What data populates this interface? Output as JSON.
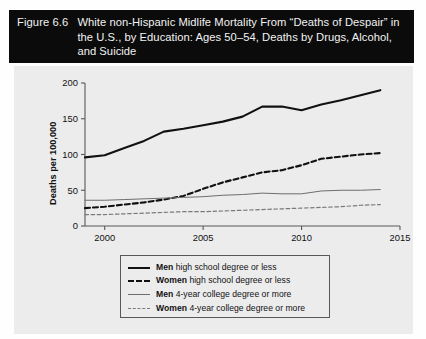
{
  "figure": {
    "number": "Figure 6.6",
    "title": "White non-Hispanic Midlife Mortality From “Deaths of Despair” in the U.S., by Education: Ages 50–54, Deaths by Drugs, Alcohol, and Suicide"
  },
  "colors": {
    "title_bar_bg": "#0b0b0b",
    "title_bar_text": "#f2f2f2",
    "panel_bg": "#ececed",
    "series_dark": "#111111",
    "series_gray": "#6e6e70",
    "axis": "#58585a"
  },
  "legend": {
    "entries": [
      {
        "emphasis": "Men",
        "label": " high school degree or less",
        "style": "solid-thick"
      },
      {
        "emphasis": "Women",
        "label": " high school degree or less",
        "style": "dash-thick"
      },
      {
        "emphasis": "Men",
        "label": " 4-year college degree or more",
        "style": "solid-thin"
      },
      {
        "emphasis": "Women",
        "label": " 4-year college degree or more",
        "style": "dash-thin"
      }
    ]
  },
  "chart_data": {
    "type": "line",
    "title": "White non-Hispanic Midlife Mortality From “Deaths of Despair” in the U.S., by Education: Ages 50–54, Deaths by Drugs, Alcohol, and Suicide",
    "xlabel": "",
    "ylabel": "Deaths per 100,000",
    "xlim": [
      1999,
      2015
    ],
    "ylim": [
      0,
      200
    ],
    "xticks": [
      2000,
      2005,
      2010,
      2015
    ],
    "yticks": [
      0,
      50,
      100,
      150,
      200
    ],
    "grid": false,
    "legend_position": "bottom-center",
    "x": [
      1999,
      2000,
      2001,
      2002,
      2003,
      2004,
      2005,
      2006,
      2007,
      2008,
      2009,
      2010,
      2011,
      2012,
      2013,
      2014
    ],
    "series": [
      {
        "name": "Men high school degree or less",
        "style": "solid-thick",
        "color": "#111111",
        "values": [
          96,
          99,
          109,
          119,
          132,
          136,
          141,
          146,
          153,
          167,
          167,
          162,
          170,
          176,
          183,
          190
        ]
      },
      {
        "name": "Women high school degree or less",
        "style": "dash-thick",
        "color": "#111111",
        "values": [
          25,
          27,
          30,
          33,
          37,
          42,
          52,
          61,
          68,
          75,
          78,
          85,
          94,
          97,
          100,
          102
        ]
      },
      {
        "name": "Men 4-year college degree or more",
        "style": "solid-thin",
        "color": "#6e6e70",
        "values": [
          36,
          36,
          37,
          38,
          39,
          40,
          41,
          43,
          44,
          46,
          45,
          45,
          49,
          50,
          50,
          51
        ]
      },
      {
        "name": "Women 4-year college degree or more",
        "style": "dash-thin",
        "color": "#7a7a7c",
        "values": [
          16,
          16,
          17,
          18,
          19,
          20,
          20,
          21,
          22,
          23,
          24,
          25,
          26,
          27,
          29,
          30
        ]
      }
    ]
  }
}
